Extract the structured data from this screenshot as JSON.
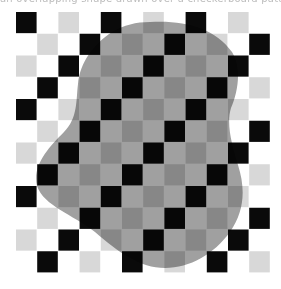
{
  "caption": "an overlapping shape drawn over a checkerboard pattern, partially obscuring the grid",
  "board": {
    "origin_x": 16,
    "origin_y": 12,
    "cell_w": 21.2,
    "cell_h": 21.75,
    "rows": 12,
    "cols": 12,
    "pattern": [
      "black",
      "white",
      "lightgray",
      "white"
    ],
    "rule": "cell(r,c) = pattern[(r + c) mod 4]"
  },
  "colors": {
    "black": "#0a0a0a",
    "white": "#ffffff",
    "lightgray": "#d8d8d8",
    "blob": "#a0a0a0"
  },
  "blob": {
    "path": "M150 22 C 185 20, 215 28, 232 52 C 242 68, 238 92, 231 108 C 226 124, 232 145, 238 165 C 246 190, 244 212, 230 232 C 214 254, 190 268, 165 268 C 140 268, 118 252, 95 232 C 72 214, 44 206, 37 186 C 32 166, 48 148, 64 132 C 78 118, 76 100, 78 84 C 80 62, 94 44, 112 32 C 124 25, 136 22, 150 22 Z"
  }
}
